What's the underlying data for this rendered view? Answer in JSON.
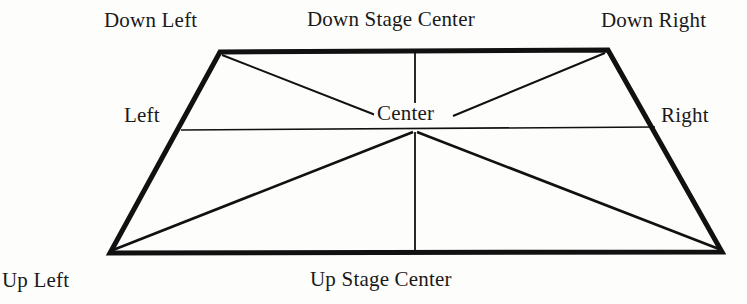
{
  "diagram": {
    "background_color": "#fdfdfb",
    "line_color": "#111111",
    "labels": {
      "down_left": "Down Left",
      "down_stage_center": "Down Stage Center",
      "down_right": "Down Right",
      "left": "Left",
      "center": "Center",
      "right": "Right",
      "up_left": "Up Left",
      "up_stage_center": "Up Stage Center"
    },
    "geometry": {
      "corners": {
        "down_left": [
          220,
          52
        ],
        "down_right": [
          608,
          50
        ],
        "up_right": [
          722,
          252
        ],
        "up_left": [
          110,
          253
        ]
      },
      "center_point": [
        415,
        130
      ],
      "horizontal_line": [
        [
          181,
          130
        ],
        [
          655,
          127
        ]
      ],
      "vertical_upper": [
        [
          415,
          51
        ],
        [
          415,
          108
        ]
      ],
      "vertical_lower": [
        [
          415,
          132
        ],
        [
          415,
          252
        ]
      ],
      "diagonal_down_left_to_center": [
        [
          222,
          54
        ],
        [
          378,
          115
        ]
      ],
      "diagonal_down_right_to_center": [
        [
          606,
          52
        ],
        [
          452,
          115
        ]
      ],
      "diagonal_up_left_to_center": [
        [
          112,
          251
        ],
        [
          413,
          132
        ]
      ],
      "diagonal_up_right_to_center": [
        [
          720,
          250
        ],
        [
          417,
          132
        ]
      ]
    }
  }
}
